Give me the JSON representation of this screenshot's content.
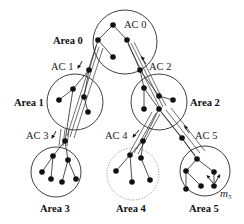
{
  "diagram": {
    "type": "hierarchical-area-tree",
    "areas": [
      {
        "id": 0,
        "label": "Area 0",
        "style": "solid"
      },
      {
        "id": 1,
        "label": "Area 1",
        "style": "solid"
      },
      {
        "id": 2,
        "label": "Area 2",
        "style": "solid"
      },
      {
        "id": 3,
        "label": "Area 3",
        "style": "solid"
      },
      {
        "id": 4,
        "label": "Area 4",
        "style": "dotted"
      },
      {
        "id": 5,
        "label": "Area 5",
        "style": "solid"
      }
    ],
    "access_channels": [
      {
        "id": 0,
        "label": "AC 0",
        "area": "Area 0"
      },
      {
        "id": 1,
        "label": "AC 1",
        "from": "Area 0",
        "to": "Area 1",
        "arrow": "down"
      },
      {
        "id": 2,
        "label": "AC 2",
        "from": "Area 2",
        "to": "Area 0",
        "arrow": "up"
      },
      {
        "id": 3,
        "label": "AC 3",
        "from": "Area 1",
        "to": "Area 3",
        "arrow": "down"
      },
      {
        "id": 4,
        "label": "AC 4",
        "from": "Area 2",
        "to": "Area 4",
        "arrow": "down"
      },
      {
        "id": 5,
        "label": "AC 5",
        "from": "Area 5",
        "to": "Area 2",
        "arrow": "up"
      }
    ],
    "mobile_node": {
      "label": "m",
      "subscript": "5",
      "area": "Area 5"
    }
  }
}
